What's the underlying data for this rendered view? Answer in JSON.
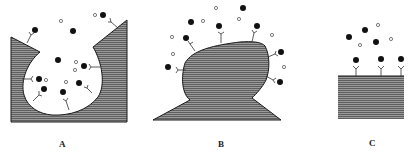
{
  "panels": [
    {
      "id": "A",
      "label": "A",
      "description": "cavity / invaginated surface with receptors lining the inner wall"
    },
    {
      "id": "B",
      "label": "B",
      "description": "convex protruding surface with receptors on the outside"
    },
    {
      "id": "C",
      "label": "C",
      "description": "flat surface with receptors on top"
    }
  ],
  "legend_glyphs": {
    "filled_circle": "ligand (bound/free, filled)",
    "open_circle": "ligand (open)",
    "y_shape": "receptor"
  },
  "colors": {
    "fill": "#8a8a8a",
    "stroke": "#1a1a1a",
    "hatch": "#5a5a5a",
    "background": "#ffffff"
  }
}
